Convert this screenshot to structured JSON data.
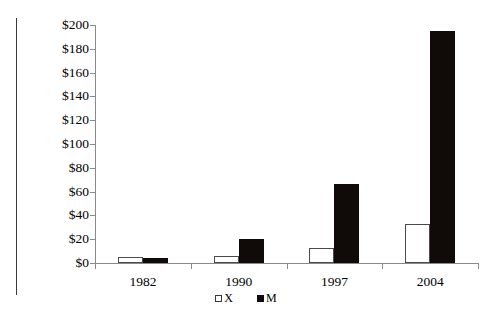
{
  "chart_data": {
    "type": "bar",
    "title": "",
    "subtitle": "",
    "xlabel": "",
    "ylabel": "",
    "categories": [
      "1982",
      "1990",
      "1997",
      "2004"
    ],
    "series": [
      {
        "name": "X",
        "color": "#ffffff",
        "values": [
          5,
          6,
          13,
          33
        ]
      },
      {
        "name": "M",
        "color": "#100a08",
        "values": [
          4,
          20,
          66,
          195
        ]
      }
    ],
    "ylim": [
      0,
      200
    ],
    "ytick_values": [
      0,
      20,
      40,
      60,
      80,
      100,
      120,
      140,
      160,
      180,
      200
    ],
    "ytick_labels": [
      "$0",
      "$20",
      "$40",
      "$60",
      "$80",
      "$100",
      "$120",
      "$140",
      "$160",
      "$180",
      "$200"
    ],
    "grid": false,
    "legend_position": "bottom",
    "legend": [
      {
        "label": "X",
        "swatch": "white-square-outline"
      },
      {
        "label": "M",
        "swatch": "black-square-filled"
      }
    ],
    "value_prefix": "$"
  }
}
